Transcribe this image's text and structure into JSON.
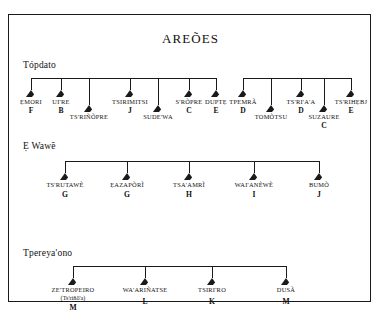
{
  "chart_title": "AREÕES",
  "sections": [
    {
      "label": "Tópdato",
      "groups": [
        {
          "members": [
            {
              "name": "ẸMORI",
              "code": "F",
              "alt": "",
              "row": "upper"
            },
            {
              "name": "UI'RE",
              "code": "B",
              "alt": "",
              "row": "upper"
            },
            {
              "name": "TS'RIÑÕPRE",
              "code": "",
              "alt": "",
              "row": "lower"
            },
            {
              "name": "TSIRIMITSI",
              "code": "J",
              "alt": "",
              "row": "upper"
            },
            {
              "name": "SUDE'WA",
              "code": "",
              "alt": "",
              "row": "lower"
            },
            {
              "name": "S'RÕPRE",
              "code": "C",
              "alt": "",
              "row": "upper"
            },
            {
              "name": "DUPTẸ",
              "code": "E",
              "alt": "",
              "row": "upper"
            }
          ]
        },
        {
          "members": [
            {
              "name": "TPEMRÃ",
              "code": "D",
              "alt": "",
              "row": "upper"
            },
            {
              "name": "TOMÕTSU",
              "code": "",
              "alt": "",
              "row": "lower"
            },
            {
              "name": "TS'RI'A'A",
              "code": "D",
              "alt": "",
              "row": "upper"
            },
            {
              "name": "SUZAURE",
              "code": "C",
              "alt": "",
              "row": "lower"
            },
            {
              "name": "TS'RIHẸBJ",
              "code": "E",
              "alt": "",
              "row": "upper"
            }
          ]
        }
      ]
    },
    {
      "label": "Ẹ Wawẽ",
      "groups": [
        {
          "members": [
            {
              "name": "TS'RUTAWẼ",
              "code": "G",
              "alt": "",
              "row": "upper"
            },
            {
              "name": "ẸAZAPÕRĨ",
              "code": "G",
              "alt": "",
              "row": "upper"
            },
            {
              "name": "TSA'AMRĨ",
              "code": "H",
              "alt": "",
              "row": "upper"
            },
            {
              "name": "WAI'ANẼWẼ",
              "code": "I",
              "alt": "",
              "row": "upper"
            },
            {
              "name": "BUMÕ",
              "code": "J",
              "alt": "",
              "row": "upper"
            }
          ]
        }
      ]
    },
    {
      "label": "Tpereya'ono",
      "groups": [
        {
          "members": [
            {
              "name": "ZE'TROPEIRO",
              "code": "M",
              "alt": "(Ts'riñõ'a)",
              "row": "upper"
            },
            {
              "name": "WA'ARIÑATSE",
              "code": "L",
              "alt": "",
              "row": "upper"
            },
            {
              "name": "TSIRI'RO",
              "code": "K",
              "alt": "",
              "row": "upper"
            },
            {
              "name": "DUSÃ",
              "code": "M",
              "alt": "",
              "row": "upper"
            }
          ]
        }
      ]
    }
  ],
  "legend": {
    "symbol_meaning": "triangle = male ego",
    "line_color": "#1a1a1a",
    "background": "#ffffff"
  },
  "layout": {
    "frame": {
      "x": 8,
      "y": 14,
      "w": 363,
      "h": 288
    },
    "section_y": [
      50,
      131,
      238
    ],
    "bracket_y": [
      68,
      151,
      256
    ],
    "group_x_spans": [
      [
        28,
        212
      ],
      [
        222,
        338
      ],
      [
        62,
        318
      ],
      [
        70,
        285
      ]
    ]
  }
}
